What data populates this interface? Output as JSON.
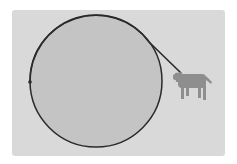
{
  "figure": {
    "colors": {
      "page": "#ffffff",
      "panel": "#d9d9d9",
      "silo_fill": "#c4c4c4",
      "outline": "#2a2a2a",
      "cow": "#8e8e8e"
    },
    "panel": {
      "x": 12,
      "y": 10,
      "width": 213,
      "height": 146
    },
    "silo": {
      "cx": 96,
      "cy": 81,
      "r": 66
    },
    "rope_anchor": {
      "x": 30,
      "y": 82
    },
    "rope_end": {
      "x": 181,
      "y": 73
    },
    "cow": {
      "x": 173,
      "y": 70,
      "width": 42,
      "height": 32,
      "icon": "cow-icon"
    }
  }
}
